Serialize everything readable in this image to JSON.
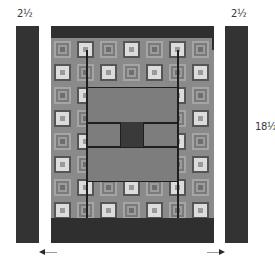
{
  "diagram": {
    "type": "quilt-assembly-diagram",
    "labels": {
      "left_strip_width": "2½",
      "right_strip_width": "2½",
      "strip_length": "18½"
    },
    "colors": {
      "dark_fabric": "#333333",
      "border_band": "#2f2f2f",
      "block_background": "#8a8a8a",
      "light_square": "#dcdcdc",
      "center_panel": "#7d7d7d",
      "center_square": "#3a3a3a",
      "seam_line": "#1e1e1e",
      "arrow": "#9a9a9a"
    },
    "components": {
      "left_strip": "left side border strip",
      "right_strip": "right side border strip",
      "quilt_center": "pieced quilt top with top and bottom borders",
      "arrows": [
        "left",
        "right"
      ]
    }
  }
}
